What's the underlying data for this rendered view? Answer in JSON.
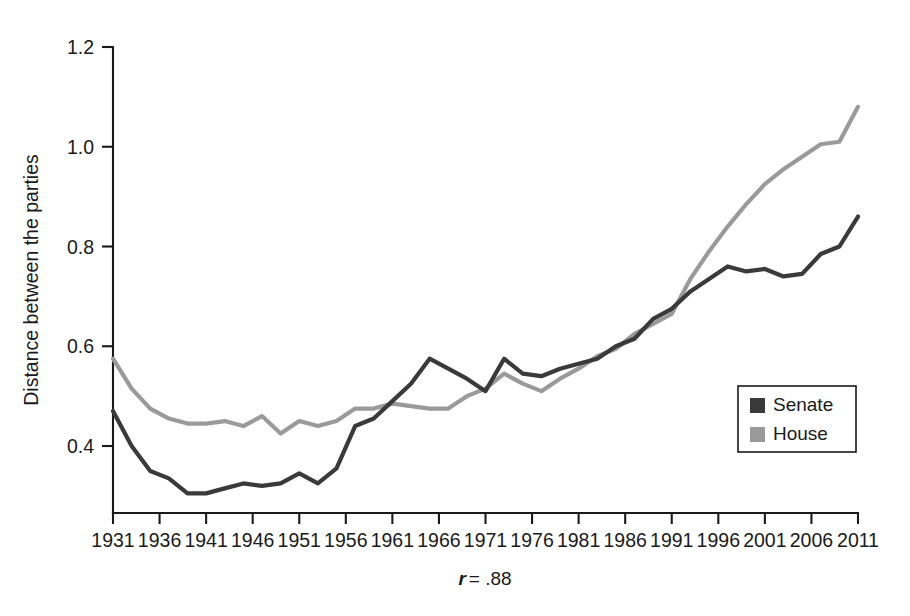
{
  "figure": {
    "background_color": "#ffffff",
    "ylabel": "Distance between the parties",
    "caption_symbol": "r",
    "caption_rest": "= .88"
  },
  "legend": {
    "position": "bottom-right-inside",
    "entries": [
      {
        "label": "Senate",
        "color": "#3a3a3a",
        "swatch": "filled-square"
      },
      {
        "label": "House",
        "color": "#9a9a9a",
        "swatch": "filled-square"
      }
    ]
  },
  "axes": {
    "y_ticks": [
      "0.4",
      "0.6",
      "0.8",
      "1.0",
      "1.2"
    ],
    "y_tick_values": [
      0.4,
      0.6,
      0.8,
      1.0,
      1.2
    ],
    "x_ticks": [
      "1931",
      "1936",
      "1941",
      "1946",
      "1951",
      "1956",
      "1961",
      "1966",
      "1971",
      "1976",
      "1981",
      "1986",
      "1991",
      "1996",
      "2001",
      "2006",
      "2011"
    ],
    "x_tick_values": [
      1931,
      1936,
      1941,
      1946,
      1951,
      1956,
      1961,
      1966,
      1971,
      1976,
      1981,
      1986,
      1991,
      1996,
      2001,
      2006,
      2011
    ],
    "xlim": [
      1931,
      2011
    ],
    "ylim": [
      0.27,
      1.2
    ],
    "grid": false
  },
  "chart_data": {
    "type": "line",
    "title": "",
    "subtitle": "",
    "xlabel": "",
    "ylabel": "Distance between the parties",
    "annotation": "r = .88",
    "xlim": [
      1931,
      2011
    ],
    "ylim": [
      0.27,
      1.2
    ],
    "grid": false,
    "legend_position": "lower right",
    "x": [
      1931,
      1933,
      1935,
      1937,
      1939,
      1941,
      1943,
      1945,
      1947,
      1949,
      1951,
      1953,
      1955,
      1957,
      1959,
      1961,
      1963,
      1965,
      1967,
      1969,
      1971,
      1973,
      1975,
      1977,
      1979,
      1981,
      1983,
      1985,
      1987,
      1989,
      1991,
      1993,
      1995,
      1997,
      1999,
      2001,
      2003,
      2005,
      2007,
      2009,
      2011
    ],
    "series": [
      {
        "name": "Senate",
        "color": "#3a3a3a",
        "values": [
          0.47,
          0.4,
          0.35,
          0.335,
          0.305,
          0.305,
          0.315,
          0.325,
          0.32,
          0.325,
          0.345,
          0.325,
          0.355,
          0.44,
          0.455,
          0.49,
          0.525,
          0.575,
          0.555,
          0.535,
          0.51,
          0.575,
          0.545,
          0.54,
          0.555,
          0.565,
          0.575,
          0.6,
          0.615,
          0.655,
          0.675,
          0.71,
          0.735,
          0.76,
          0.75,
          0.755,
          0.74,
          0.745,
          0.785,
          0.8,
          0.86
        ]
      },
      {
        "name": "House",
        "color": "#9a9a9a",
        "values": [
          0.575,
          0.515,
          0.475,
          0.455,
          0.445,
          0.445,
          0.45,
          0.44,
          0.46,
          0.425,
          0.45,
          0.44,
          0.45,
          0.475,
          0.475,
          0.485,
          0.48,
          0.475,
          0.475,
          0.5,
          0.515,
          0.545,
          0.525,
          0.51,
          0.535,
          0.555,
          0.58,
          0.595,
          0.625,
          0.645,
          0.665,
          0.735,
          0.79,
          0.84,
          0.885,
          0.925,
          0.955,
          0.98,
          1.005,
          1.01,
          1.08
        ]
      }
    ]
  }
}
